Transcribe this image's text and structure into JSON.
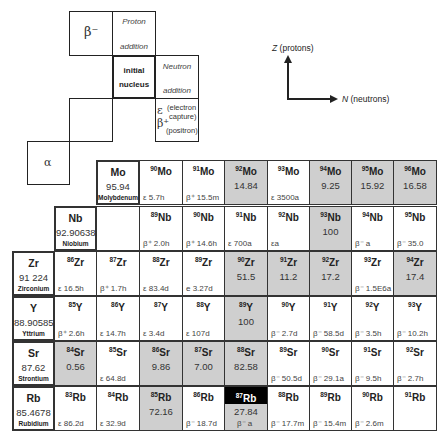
{
  "legend": {
    "beta_minus": "β⁻",
    "proton_line1": "Proton",
    "proton_line2": "addition",
    "initial_line1": "initial",
    "initial_line2": "nucleus",
    "neutron_line1": "Neutron",
    "neutron_line2": "addition",
    "ec_symbol": "ε",
    "ec_text1": "(electron",
    "ec_text2": "capture)",
    "bplus_symbol": "β⁺",
    "bplus_text": "(positron)",
    "alpha": "α"
  },
  "axes": {
    "z_var": "Z",
    "z_label": "(protons)",
    "n_var": "N",
    "n_label": "(neutrons)"
  },
  "colors": {
    "stable": "#cfcfcf",
    "highlight": "#000000",
    "border": "#333333"
  },
  "rows": [
    {
      "element": {
        "symbol": "Mo",
        "weight": "95.94",
        "name": "Molybdenum"
      },
      "cells": [
        {
          "mass": "90",
          "sym": "Mo",
          "abundance": "",
          "decay": "ε 5.7h",
          "stable": false
        },
        {
          "mass": "91",
          "sym": "Mo",
          "abundance": "",
          "decay": "β⁺ 15.5m",
          "stable": false
        },
        {
          "mass": "92",
          "sym": "Mo",
          "abundance": "14.84",
          "decay": "",
          "stable": true
        },
        {
          "mass": "93",
          "sym": "Mo",
          "abundance": "",
          "decay": "ε 3500a",
          "stable": false
        },
        {
          "mass": "94",
          "sym": "Mo",
          "abundance": "9.25",
          "decay": "",
          "stable": true
        },
        {
          "mass": "95",
          "sym": "Mo",
          "abundance": "15.92",
          "decay": "",
          "stable": true
        },
        {
          "mass": "96",
          "sym": "Mo",
          "abundance": "16.58",
          "decay": "",
          "stable": true
        }
      ]
    },
    {
      "element": {
        "symbol": "Nb",
        "weight": "92.90638",
        "name": "Niobium"
      },
      "cells": [
        {
          "mass": "",
          "sym": "",
          "abundance": "",
          "decay": "",
          "stable": false
        },
        {
          "mass": "89",
          "sym": "Nb",
          "abundance": "",
          "decay": "β⁺ 2.0h",
          "stable": false
        },
        {
          "mass": "90",
          "sym": "Nb",
          "abundance": "",
          "decay": "β⁺ 14.6h",
          "stable": false
        },
        {
          "mass": "91",
          "sym": "Nb",
          "abundance": "",
          "decay": "ε 700a",
          "stable": false
        },
        {
          "mass": "92",
          "sym": "Nb",
          "abundance": "",
          "decay": "εa",
          "stable": false
        },
        {
          "mass": "93",
          "sym": "Nb",
          "abundance": "100",
          "decay": "",
          "stable": true
        },
        {
          "mass": "94",
          "sym": "Nb",
          "abundance": "",
          "decay": "β⁻ a",
          "stable": false
        },
        {
          "mass": "95",
          "sym": "Nb",
          "abundance": "",
          "decay": "β⁻ 35.0",
          "stable": false
        }
      ]
    },
    {
      "element": {
        "symbol": "Zr",
        "weight": "91 224",
        "name": "Zirconium"
      },
      "cells": [
        {
          "mass": "86",
          "sym": "Zr",
          "abundance": "",
          "decay": "ε 16.5h",
          "stable": false
        },
        {
          "mass": "87",
          "sym": "Zr",
          "abundance": "",
          "decay": "β⁺ 1.7h",
          "stable": false
        },
        {
          "mass": "88",
          "sym": "Zr",
          "abundance": "",
          "decay": "ε 83.4d",
          "stable": false
        },
        {
          "mass": "89",
          "sym": "Zr",
          "abundance": "",
          "decay": "e 3.27d",
          "stable": false
        },
        {
          "mass": "90",
          "sym": "Zr",
          "abundance": "51.5",
          "decay": "",
          "stable": true
        },
        {
          "mass": "91",
          "sym": "Zr",
          "abundance": "11.2",
          "decay": "",
          "stable": true
        },
        {
          "mass": "92",
          "sym": "Zr",
          "abundance": "17.2",
          "decay": "",
          "stable": true
        },
        {
          "mass": "93",
          "sym": "Zr",
          "abundance": "",
          "decay": "β⁻ 1.5E6a",
          "stable": false
        },
        {
          "mass": "94",
          "sym": "Zr",
          "abundance": "17.4",
          "decay": "",
          "stable": true
        }
      ]
    },
    {
      "element": {
        "symbol": "Y",
        "weight": "88.90585",
        "name": "Yttrium"
      },
      "cells": [
        {
          "mass": "85",
          "sym": "Y",
          "abundance": "",
          "decay": "β⁺ 2.6h",
          "stable": false
        },
        {
          "mass": "86",
          "sym": "Y",
          "abundance": "",
          "decay": "ε 14.7h",
          "stable": false
        },
        {
          "mass": "87",
          "sym": "Y",
          "abundance": "",
          "decay": "ε 3.4d",
          "stable": false
        },
        {
          "mass": "88",
          "sym": "Y",
          "abundance": "",
          "decay": "ε 107d",
          "stable": false
        },
        {
          "mass": "89",
          "sym": "Y",
          "abundance": "100",
          "decay": "",
          "stable": true
        },
        {
          "mass": "90",
          "sym": "Y",
          "abundance": "",
          "decay": "β⁻ 2.7d",
          "stable": false
        },
        {
          "mass": "91",
          "sym": "Y",
          "abundance": "",
          "decay": "β⁻ 58.5d",
          "stable": false
        },
        {
          "mass": "92",
          "sym": "Y",
          "abundance": "",
          "decay": "β⁻ 3.5h",
          "stable": false
        },
        {
          "mass": "93",
          "sym": "Y",
          "abundance": "",
          "decay": "β⁻ 10.2h",
          "stable": false
        }
      ]
    },
    {
      "element": {
        "symbol": "Sr",
        "weight": "87.62",
        "name": "Strontium"
      },
      "cells": [
        {
          "mass": "84",
          "sym": "Sr",
          "abundance": "0.56",
          "decay": "",
          "stable": true
        },
        {
          "mass": "85",
          "sym": "Sr",
          "abundance": "",
          "decay": "ε 64.8d",
          "stable": false
        },
        {
          "mass": "86",
          "sym": "Sr",
          "abundance": "9.86",
          "decay": "",
          "stable": true
        },
        {
          "mass": "87",
          "sym": "Sr",
          "abundance": "7.00",
          "decay": "",
          "stable": true
        },
        {
          "mass": "88",
          "sym": "Sr",
          "abundance": "82.58",
          "decay": "",
          "stable": true
        },
        {
          "mass": "89",
          "sym": "Sr",
          "abundance": "",
          "decay": "β⁻ 50.5d",
          "stable": false
        },
        {
          "mass": "90",
          "sym": "Sr",
          "abundance": "",
          "decay": "β⁻ 29.1a",
          "stable": false
        },
        {
          "mass": "91",
          "sym": "Sr",
          "abundance": "",
          "decay": "β⁻ 9.5h",
          "stable": false
        },
        {
          "mass": "92",
          "sym": "Sr",
          "abundance": "",
          "decay": "β⁻ 2.7h",
          "stable": false
        }
      ]
    },
    {
      "element": {
        "symbol": "Rb",
        "weight": "85.4678",
        "name": "Rubidium"
      },
      "cells": [
        {
          "mass": "83",
          "sym": "Rb",
          "abundance": "",
          "decay": "ε 86.2d",
          "stable": false
        },
        {
          "mass": "84",
          "sym": "Rb",
          "abundance": "",
          "decay": "ε 32.9d",
          "stable": false
        },
        {
          "mass": "85",
          "sym": "Rb",
          "abundance": "72.16",
          "decay": "",
          "stable": true
        },
        {
          "mass": "86",
          "sym": "Rb",
          "abundance": "",
          "decay": "β⁻ 18.7d",
          "stable": false
        },
        {
          "mass": "87",
          "sym": "Rb",
          "abundance": "27.84",
          "decay": "β⁻ a",
          "stable": true,
          "highlight": true
        },
        {
          "mass": "88",
          "sym": "Rb",
          "abundance": "",
          "decay": "β⁻ 17.7m",
          "stable": false
        },
        {
          "mass": "89",
          "sym": "Rb",
          "abundance": "",
          "decay": "β⁻ 15.4m",
          "stable": false
        },
        {
          "mass": "90",
          "sym": "Rb",
          "abundance": "",
          "decay": "β⁻ 2.6m",
          "stable": false
        },
        {
          "mass": "91",
          "sym": "Rb",
          "abundance": "",
          "decay": "",
          "stable": false
        }
      ]
    }
  ]
}
